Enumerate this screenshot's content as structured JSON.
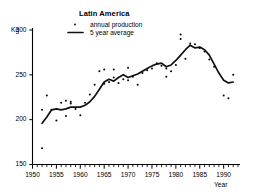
{
  "chart_data": {
    "type": "scatter",
    "title": "Latin America",
    "xlabel": "Year",
    "ylabel": "Kg",
    "xlim": [
      1950,
      1993
    ],
    "ylim": [
      150,
      300
    ],
    "yticks": [
      150,
      200,
      250,
      300
    ],
    "xticks": [
      1950,
      1955,
      1960,
      1965,
      1970,
      1975,
      1980,
      1985,
      1990
    ],
    "xtick_labels": [
      "1950",
      "1955",
      "1960",
      "1965",
      "1970",
      "1975",
      "1980",
      "1985",
      "1990"
    ],
    "ytick_labels": [
      "150",
      "200",
      "250",
      "300"
    ],
    "minor_xticks_every": 1,
    "grid": false,
    "legend_position": "top-center",
    "legend": [
      {
        "name": "annual production",
        "marker": "dot"
      },
      {
        "name": "5 year average",
        "marker": "line"
      }
    ],
    "series": [
      {
        "name": "annual production",
        "marker": "dot",
        "x": [
          1952,
          1952,
          1953,
          1954,
          1955,
          1956,
          1957,
          1957,
          1958,
          1958,
          1959,
          1960,
          1961,
          1962,
          1963,
          1964,
          1965,
          1965,
          1966,
          1967,
          1967,
          1968,
          1969,
          1970,
          1970,
          1971,
          1972,
          1973,
          1974,
          1975,
          1976,
          1977,
          1978,
          1978,
          1979,
          1980,
          1981,
          1981,
          1982,
          1983,
          1984,
          1985,
          1986,
          1987,
          1988,
          1990,
          1991,
          1992
        ],
        "y": [
          168,
          211,
          227,
          211,
          199,
          219,
          204,
          221,
          220,
          218,
          212,
          205,
          219,
          228,
          239,
          254,
          256,
          240,
          242,
          256,
          247,
          241,
          245,
          258,
          244,
          248,
          239,
          252,
          255,
          257,
          263,
          260,
          257,
          248,
          254,
          261,
          295,
          290,
          268,
          285,
          284,
          280,
          276,
          267,
          259,
          227,
          224,
          250
        ]
      },
      {
        "name": "5 year average",
        "marker": "line",
        "x": [
          1952,
          1953,
          1954,
          1955,
          1956,
          1957,
          1958,
          1959,
          1960,
          1961,
          1962,
          1963,
          1964,
          1965,
          1966,
          1967,
          1968,
          1969,
          1970,
          1971,
          1972,
          1973,
          1974,
          1975,
          1976,
          1977,
          1978,
          1979,
          1980,
          1981,
          1982,
          1983,
          1984,
          1985,
          1986,
          1987,
          1988,
          1989,
          1990,
          1991,
          1992
        ],
        "y": [
          196,
          203,
          211,
          212,
          211,
          212,
          214,
          214,
          214,
          216,
          220,
          226,
          234,
          242,
          245,
          243,
          247,
          250,
          247,
          249,
          251,
          254,
          257,
          260,
          262,
          263,
          259,
          261,
          266,
          272,
          278,
          283,
          280,
          281,
          278,
          272,
          262,
          252,
          244,
          241,
          242
        ]
      }
    ]
  },
  "axis": {
    "y_unit": "Kg",
    "x_title": "Year"
  }
}
